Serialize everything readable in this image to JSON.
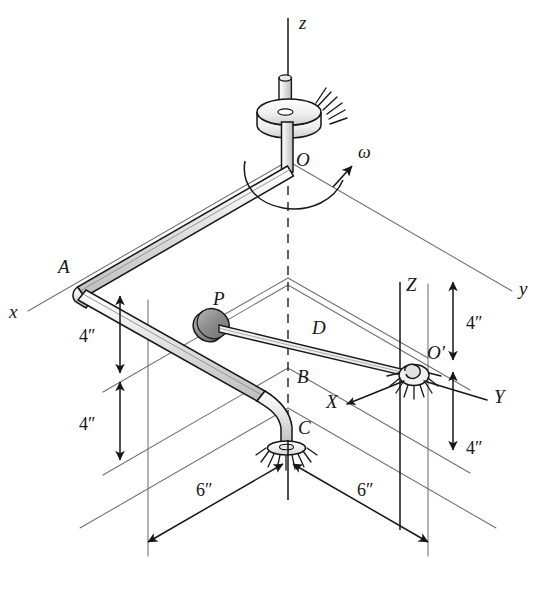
{
  "figure": {
    "type": "engineering-mechanism-diagram",
    "background_color": "#ffffff",
    "ink_color": "#161616",
    "construction_line_color": "#6f6f6f",
    "shaft_fill_light": "#f1f1f1",
    "shaft_fill_mid": "#d2d2d2",
    "collar_fill": "#9d9d9d"
  },
  "labels": {
    "origin_O": "O",
    "point_A": "A",
    "point_P": "P",
    "point_B": "B",
    "point_C": "C",
    "point_O_prime": "O′",
    "link_D": "D",
    "omega": "ω"
  },
  "axes": {
    "fixed": [
      {
        "name": "z",
        "label": "z"
      },
      {
        "name": "x",
        "label": "x"
      },
      {
        "name": "y",
        "label": "y"
      }
    ],
    "moving": [
      {
        "name": "Z",
        "label": "Z"
      },
      {
        "name": "X",
        "label": "X"
      },
      {
        "name": "Y",
        "label": "Y"
      }
    ]
  },
  "dimensions": [
    {
      "id": "left-upper",
      "value": "4″",
      "orientation": "vertical"
    },
    {
      "id": "left-lower",
      "value": "4″",
      "orientation": "vertical"
    },
    {
      "id": "right-upper",
      "value": "4″",
      "orientation": "vertical"
    },
    {
      "id": "right-lower",
      "value": "4″",
      "orientation": "vertical"
    },
    {
      "id": "bottom-left",
      "value": "6″",
      "orientation": "oblique"
    },
    {
      "id": "bottom-right",
      "value": "6″",
      "orientation": "oblique"
    }
  ]
}
